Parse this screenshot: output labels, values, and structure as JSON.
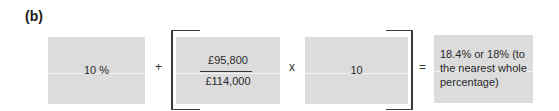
{
  "part_label": "(b)",
  "equation": {
    "term1": "10 %",
    "op_plus": "+",
    "fraction": {
      "numerator": "£95,800",
      "denominator": "£114,000"
    },
    "op_times": "x",
    "term3": "10",
    "op_equals": "=",
    "result": "18.4% or 18% (to the nearest whole percentage)"
  },
  "colors": {
    "box_fill": "#dcdcdc",
    "bracket": "#3a3a3a",
    "text": "#2a2a2a"
  }
}
